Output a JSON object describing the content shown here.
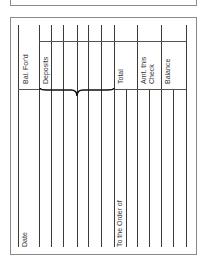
{
  "form": {
    "type": "check register stub (rotated)",
    "labels": {
      "bal_fwd": "Bal. For'd",
      "deposits": "Deposits",
      "total": "Total",
      "amt_this_check_line1": "Amt. this",
      "amt_this_check_line2": "Check",
      "balance": "Balance",
      "date": "Date",
      "to_the_order_of": "To the Order of"
    },
    "colors": {
      "line": "#3a3a3a",
      "border": "#8a8a8a",
      "text": "#333333"
    }
  }
}
